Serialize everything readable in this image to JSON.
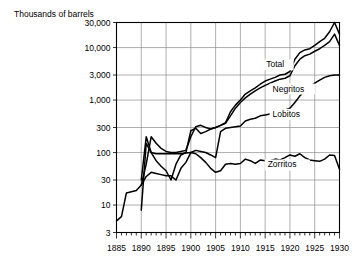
{
  "chart_data": {
    "type": "line",
    "title": "Thousands of barrels",
    "xlabel": "",
    "ylabel": "Thousands of barrels",
    "xlim": [
      1885,
      1930
    ],
    "ylim": [
      3,
      30000
    ],
    "yscale": "log",
    "grid": true,
    "legend_position": "inline-labels",
    "y_ticks": [
      3,
      10,
      30,
      100,
      300,
      1000,
      3000,
      10000,
      30000
    ],
    "y_tick_labels": [
      "3",
      "10",
      "30",
      "100",
      "300",
      "1,000",
      "3,000",
      "10,000",
      "30,000"
    ],
    "x_ticks": [
      1885,
      1890,
      1895,
      1900,
      1905,
      1910,
      1915,
      1920,
      1925,
      1930
    ],
    "x_tick_labels": [
      "1885",
      "1890",
      "1895",
      "1900",
      "1905",
      "1910",
      "1915",
      "1920",
      "1925",
      "1930"
    ],
    "x_minor_tick_step": 1,
    "series": [
      {
        "name": "Total",
        "label": "Total",
        "label_x": 1915.2,
        "label_y": 4200,
        "x": [
          1885,
          1886,
          1887,
          1888,
          1889,
          1890,
          1891,
          1892,
          1893,
          1894,
          1895,
          1896,
          1897,
          1898,
          1899,
          1900,
          1901,
          1902,
          1903,
          1904,
          1905,
          1906,
          1907,
          1908,
          1909,
          1910,
          1911,
          1912,
          1913,
          1914,
          1915,
          1916,
          1917,
          1918,
          1919,
          1920,
          1921,
          1922,
          1923,
          1924,
          1925,
          1926,
          1927,
          1928,
          1929,
          1930
        ],
        "values": [
          5,
          6,
          17,
          18,
          19,
          24,
          60,
          200,
          150,
          120,
          105,
          100,
          100,
          105,
          110,
          200,
          310,
          330,
          300,
          280,
          300,
          330,
          370,
          600,
          800,
          1000,
          1300,
          1500,
          1700,
          2000,
          2300,
          2500,
          2700,
          3000,
          3100,
          3500,
          6000,
          8000,
          9000,
          9500,
          11000,
          13000,
          15000,
          20000,
          30000,
          18000
        ]
      },
      {
        "name": "Negritos",
        "label": "Negritos",
        "label_x": 1916.5,
        "label_y": 1450,
        "x": [
          1890,
          1891,
          1892,
          1893,
          1894,
          1895,
          1896,
          1897,
          1898,
          1899,
          1900,
          1901,
          1902,
          1903,
          1904,
          1905,
          1906,
          1907,
          1908,
          1909,
          1910,
          1911,
          1912,
          1913,
          1914,
          1915,
          1916,
          1917,
          1918,
          1919,
          1920,
          1921,
          1922,
          1923,
          1924,
          1925,
          1926,
          1927,
          1928,
          1929,
          1930
        ],
        "values": [
          8,
          150,
          100,
          70,
          55,
          45,
          30,
          60,
          90,
          100,
          260,
          290,
          230,
          250,
          280,
          300,
          330,
          360,
          500,
          700,
          900,
          1100,
          1300,
          1500,
          1700,
          1900,
          2100,
          2300,
          2500,
          2600,
          2900,
          4500,
          6000,
          7000,
          7500,
          8500,
          9500,
          11000,
          13000,
          18000,
          11000
        ]
      },
      {
        "name": "Lobitos",
        "label": "Lobitos",
        "label_x": 1916.5,
        "label_y": 480,
        "x": [
          1890,
          1891,
          1892,
          1893,
          1894,
          1895,
          1896,
          1897,
          1898,
          1899,
          1900,
          1901,
          1902,
          1903,
          1904,
          1905,
          1906,
          1907,
          1908,
          1909,
          1910,
          1911,
          1912,
          1913,
          1914,
          1915,
          1916,
          1917,
          1918,
          1919,
          1920,
          1921,
          1922,
          1923,
          1924,
          1925,
          1926,
          1927,
          1928,
          1929,
          1930
        ],
        "values": [
          24,
          35,
          42,
          40,
          38,
          36,
          36,
          30,
          50,
          65,
          100,
          110,
          105,
          100,
          90,
          80,
          250,
          290,
          300,
          310,
          320,
          400,
          430,
          450,
          500,
          520,
          540,
          600,
          620,
          650,
          700,
          900,
          1200,
          1500,
          1800,
          2100,
          2400,
          2700,
          2900,
          3000,
          3000
        ]
      },
      {
        "name": "Zorritos",
        "label": "Zorritos",
        "label_x": 1915.5,
        "label_y": 52,
        "x": [
          1890,
          1891,
          1892,
          1893,
          1894,
          1895,
          1896,
          1897,
          1898,
          1899,
          1900,
          1901,
          1902,
          1903,
          1904,
          1905,
          1906,
          1907,
          1908,
          1909,
          1910,
          1911,
          1912,
          1913,
          1914,
          1915,
          1916,
          1917,
          1918,
          1919,
          1920,
          1921,
          1922,
          1923,
          1924,
          1925,
          1926,
          1927,
          1928,
          1929,
          1930
        ],
        "values": [
          30,
          200,
          100,
          95,
          95,
          95,
          95,
          95,
          95,
          98,
          100,
          95,
          80,
          65,
          50,
          42,
          45,
          60,
          62,
          60,
          62,
          75,
          70,
          62,
          72,
          70,
          70,
          75,
          72,
          80,
          90,
          85,
          95,
          80,
          72,
          70,
          68,
          75,
          90,
          88,
          48
        ]
      }
    ]
  }
}
